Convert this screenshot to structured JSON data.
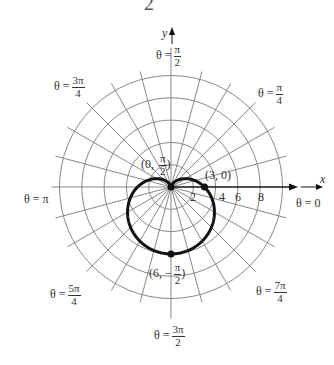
{
  "figure": {
    "top_fragment": "2",
    "axes": {
      "x_label": "x",
      "y_label": "y"
    },
    "angle_labels": [
      {
        "id": "pi_over_2",
        "prefix": "θ =",
        "num": "π",
        "den": "2"
      },
      {
        "id": "3pi_over_4",
        "prefix": "θ =",
        "num": "3π",
        "den": "4"
      },
      {
        "id": "pi_over_4",
        "prefix": "θ =",
        "num": "π",
        "den": "4"
      },
      {
        "id": "pi",
        "prefix": "θ = π"
      },
      {
        "id": "zero",
        "prefix": "θ = 0"
      },
      {
        "id": "5pi_over_4",
        "prefix": "θ =",
        "num": "5π",
        "den": "4"
      },
      {
        "id": "7pi_over_4",
        "prefix": "θ =",
        "num": "7π",
        "den": "4"
      },
      {
        "id": "3pi_over_2",
        "prefix": "θ =",
        "num": "3π",
        "den": "2"
      }
    ],
    "tick_labels": [
      "2",
      "4",
      "6",
      "8"
    ],
    "points": [
      {
        "label_pre": "(0, ",
        "num": "π",
        "den": "2",
        "label_post": ")"
      },
      {
        "label": "(3, 0)"
      },
      {
        "label_pre": "(6, −",
        "num": "π",
        "den": "2",
        "label_post": ")"
      }
    ],
    "curve_equation": "r = 3 − 3 sin θ",
    "colors": {
      "grid": "#7a7a7a",
      "curve": "#111111",
      "axis": "#111111"
    }
  },
  "chart_data": {
    "type": "polar",
    "title": "",
    "curve": "r = 3 - 3 sin(theta) (cardioid)",
    "grid_radii": [
      2,
      4,
      6,
      8,
      10
    ],
    "radial_lines_deg_step": 15,
    "axis_tick_labels": [
      2,
      4,
      6,
      8
    ],
    "labeled_points": [
      {
        "r": 0,
        "theta": "π/2"
      },
      {
        "r": 3,
        "theta": "0"
      },
      {
        "r": 6,
        "theta": "-π/2"
      }
    ],
    "angle_labels": [
      "0",
      "π/4",
      "π/2",
      "3π/4",
      "π",
      "5π/4",
      "3π/2",
      "7π/4"
    ]
  }
}
